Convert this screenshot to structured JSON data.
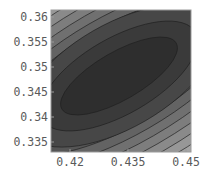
{
  "chart_data": {
    "type": "heatmap",
    "subtype": "contour",
    "title": "",
    "xlabel": "",
    "ylabel": "",
    "xlim": [
      0.415,
      0.451
    ],
    "ylim": [
      0.3335,
      0.3612
    ],
    "x_ticks": [
      "0.42",
      "0.435",
      "0.45"
    ],
    "y_ticks": [
      "0.36",
      "0.355",
      "0.35",
      "0.345",
      "0.34",
      "0.335"
    ],
    "grid": false,
    "legend": null,
    "minimum_region_center": [
      0.434,
      0.3485
    ],
    "contour_orientation": "ellipses elongated along diagonal (lower-left to upper-right)",
    "shading": "grayscale, darkest at minimum, lighter toward upper-left and lower-right corners",
    "contour_levels": 14
  },
  "axes": {
    "x_ticks": [
      {
        "label": "0.42",
        "value": 0.42
      },
      {
        "label": "0.435",
        "value": 0.435
      },
      {
        "label": "0.45",
        "value": 0.45
      }
    ],
    "y_ticks": [
      {
        "label": "0.36",
        "value": 0.36
      },
      {
        "label": "0.355",
        "value": 0.355
      },
      {
        "label": "0.35",
        "value": 0.35
      },
      {
        "label": "0.345",
        "value": 0.345
      },
      {
        "label": "0.34",
        "value": 0.34
      },
      {
        "label": "0.335",
        "value": 0.335
      }
    ]
  },
  "colors": {
    "frame": "#9a9a9a",
    "levels": [
      "#2e2e2e",
      "#3a3a3a",
      "#474747",
      "#555555",
      "#636363",
      "#707070",
      "#7d7d7d",
      "#8a8a8a",
      "#979797",
      "#a4a4a4",
      "#b1b1b1",
      "#bebebe",
      "#cbcbcb",
      "#d8d8d8",
      "#e4e4e4"
    ],
    "contour_line": "#1e1e1e"
  }
}
